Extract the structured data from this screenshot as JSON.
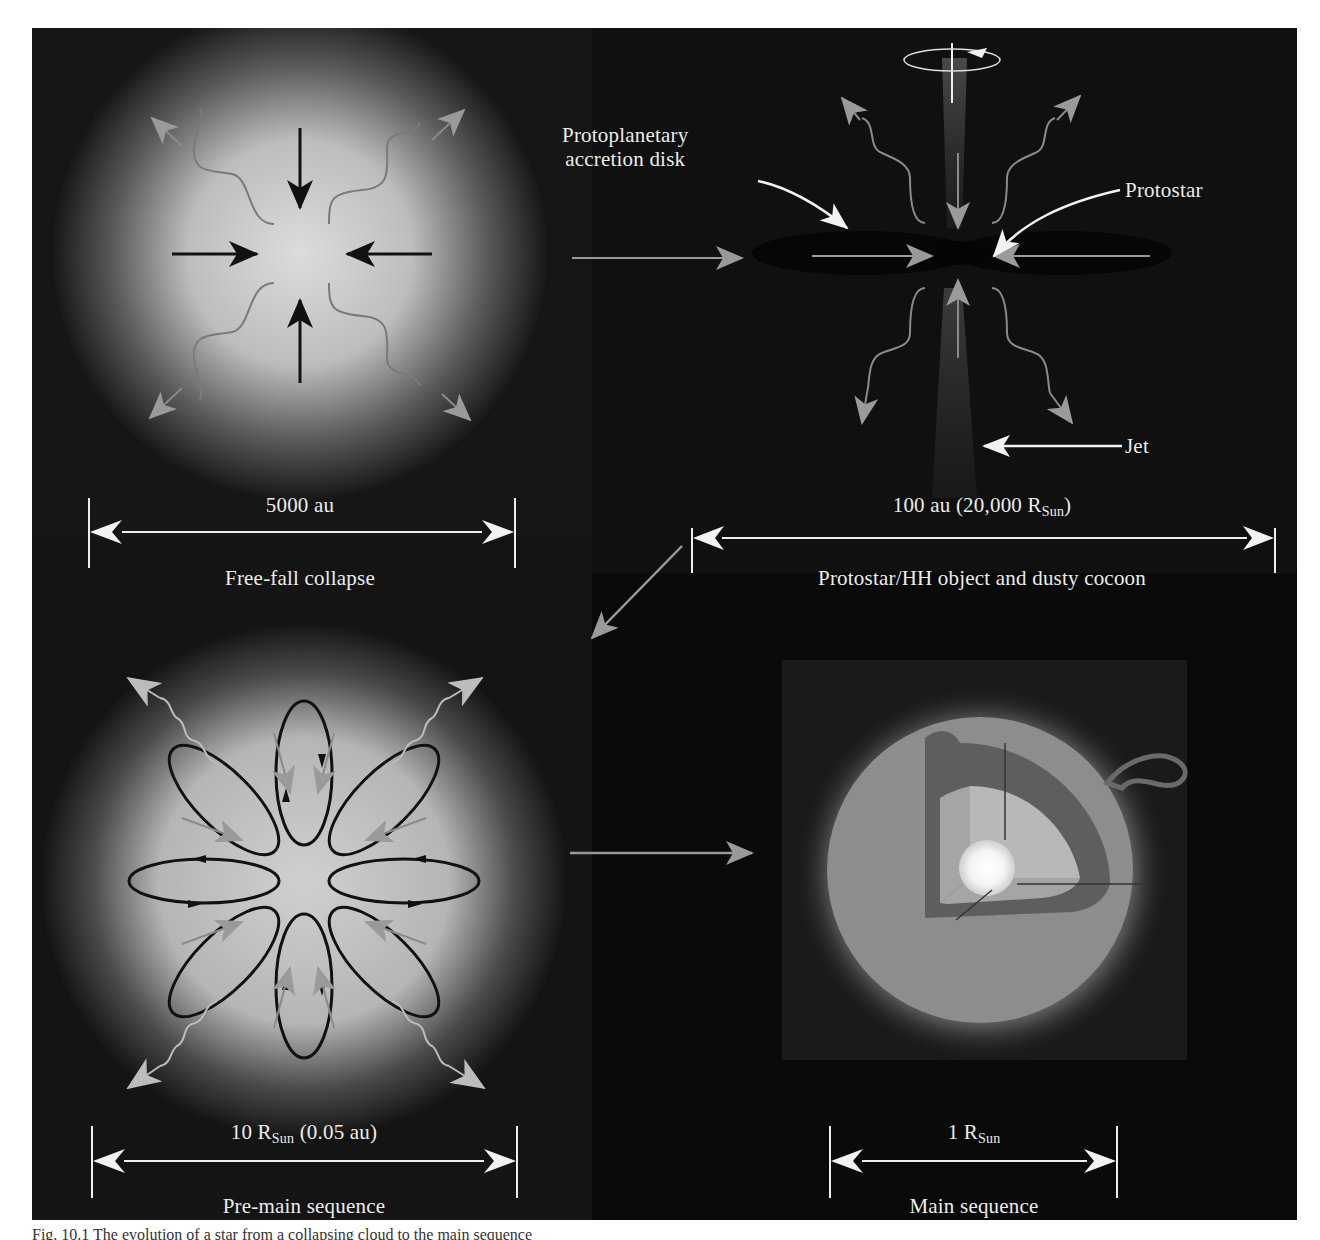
{
  "figure": {
    "panels": [
      {
        "id": "free-fall",
        "scale_value": "5000 au",
        "stage_label": "Free-fall collapse"
      },
      {
        "id": "protostar",
        "scale_value_main": "100 au (20,000 R",
        "scale_value_sub": "Sun",
        "scale_value_tail": ")",
        "stage_label": "Protostar/HH object and dusty cocoon",
        "annotations": {
          "disk_line1": "Protoplanetary",
          "disk_line2": "accretion disk",
          "protostar": "Protostar",
          "jet": "Jet"
        }
      },
      {
        "id": "pre-main-sequence",
        "scale_value_main": "10 R",
        "scale_value_sub": "Sun",
        "scale_value_tail": " (0.05 au)",
        "stage_label": "Pre-main sequence"
      },
      {
        "id": "main-sequence",
        "scale_value_main": "1 R",
        "scale_value_sub": "Sun",
        "stage_label": "Main sequence"
      }
    ],
    "colors": {
      "background": "#0b0b0b",
      "label_text": "#ececec",
      "arrow_white": "#f2f2f2",
      "arrow_gray": "#9a9a9a",
      "arrow_black": "#111111"
    }
  },
  "caption": {
    "text": "Fig. 10.1  The evolution of a star from a collapsing cloud to the main sequence"
  }
}
